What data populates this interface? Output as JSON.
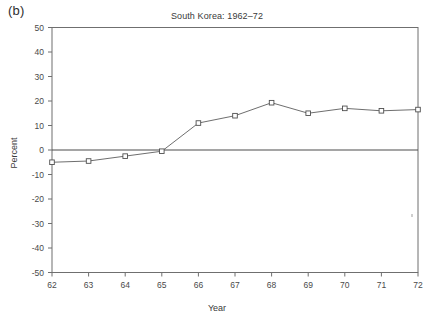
{
  "figure": {
    "panel_label": "(b)",
    "title": "South Korea: 1962–72",
    "xlabel": "Year",
    "ylabel": "Percent"
  },
  "chart_data": {
    "type": "line",
    "title": "South Korea: 1962–72",
    "xlabel": "Year",
    "ylabel": "Percent",
    "x": [
      62,
      63,
      64,
      65,
      66,
      67,
      68,
      69,
      70,
      71,
      72
    ],
    "categories": [
      "62",
      "63",
      "64",
      "65",
      "66",
      "67",
      "68",
      "69",
      "70",
      "71",
      "72"
    ],
    "values": [
      -5,
      -4.5,
      -2.5,
      -0.5,
      11,
      14,
      19.3,
      15,
      17,
      16,
      16.5
    ],
    "series": [
      {
        "name": "Percent",
        "values": [
          -5,
          -4.5,
          -2.5,
          -0.5,
          11,
          14,
          19.3,
          15,
          17,
          16,
          16.5
        ]
      }
    ],
    "xlim": [
      62,
      72
    ],
    "ylim": [
      -50,
      50
    ],
    "yticks": [
      50,
      40,
      30,
      20,
      10,
      0,
      -10,
      -20,
      -30,
      -40,
      -50
    ],
    "ytick_labels": [
      "50",
      "40",
      "30",
      "20",
      "10",
      "0",
      "-10",
      "-20",
      "-30",
      "-40",
      "-50"
    ],
    "xticks": [
      62,
      63,
      64,
      65,
      66,
      67,
      68,
      69,
      70,
      71,
      72
    ],
    "xtick_labels": [
      "62",
      "63",
      "64",
      "65",
      "66",
      "67",
      "68",
      "69",
      "70",
      "71",
      "72"
    ],
    "grid": false,
    "legend": null,
    "marker": "square",
    "reference_line_y": 0,
    "line_color": "#5d5d5d",
    "marker_facecolor": "#ffffff",
    "marker_edgecolor": "#4f4f4f",
    "axis_color": "#6f6f6f"
  }
}
